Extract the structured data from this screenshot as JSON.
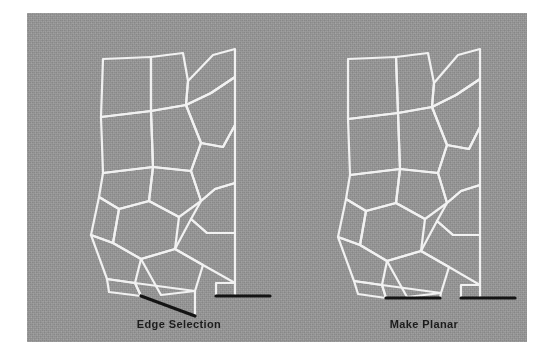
{
  "figure": {
    "kind": "3d-mesh-comparison-figure",
    "plate": {
      "background_color": "#969696",
      "page_color": "#ffffff",
      "x": 27,
      "y": 13,
      "width": 500,
      "height": 329
    },
    "style": {
      "wireframe_color": "#f2f2f2",
      "wireframe_width": 2.2,
      "selected_edge_color": "#141414",
      "selected_edge_width": 3.2,
      "caption_color": "#1c1c1c"
    },
    "panels": [
      {
        "id": "left",
        "caption": "Edge Selection",
        "description": "Quad mesh with an octagonal hole; one bottom edge is selected and is non-planar (slanted).",
        "selected_edges": [
          {
            "x1": 58,
            "y1": 263,
            "x2": 112,
            "y2": 283,
            "planar": false
          },
          {
            "x1": 133,
            "y1": 263,
            "x2": 187,
            "y2": 263,
            "planar": true
          }
        ]
      },
      {
        "id": "right",
        "caption": "Make Planar",
        "description": "Same mesh after the Make Planar operation; the selected edges are flattened to horizontal.",
        "selected_edges": [
          {
            "x1": 58,
            "y1": 265,
            "x2": 112,
            "y2": 265,
            "planar": true
          },
          {
            "x1": 133,
            "y1": 265,
            "x2": 187,
            "y2": 265,
            "planar": true
          }
        ]
      }
    ],
    "mesh": {
      "left_origin": {
        "x": 56,
        "y": 20
      },
      "right_origin": {
        "x": 301,
        "y": 20
      },
      "left_polygons": [
        [
          [
            20,
            26
          ],
          [
            68,
            24
          ],
          [
            68,
            78
          ],
          [
            18,
            84
          ]
        ],
        [
          [
            68,
            24
          ],
          [
            100,
            20
          ],
          [
            105,
            48
          ],
          [
            103,
            72
          ],
          [
            68,
            78
          ]
        ],
        [
          [
            103,
            72
          ],
          [
            105,
            48
          ],
          [
            130,
            22
          ],
          [
            152,
            16
          ],
          [
            152,
            44
          ],
          [
            128,
            60
          ]
        ],
        [
          [
            18,
            84
          ],
          [
            68,
            78
          ],
          [
            70,
            134
          ],
          [
            20,
            140
          ]
        ],
        [
          [
            68,
            78
          ],
          [
            103,
            72
          ],
          [
            118,
            110
          ],
          [
            108,
            138
          ],
          [
            70,
            134
          ]
        ],
        [
          [
            103,
            72
          ],
          [
            128,
            60
          ],
          [
            152,
            44
          ],
          [
            152,
            92
          ],
          [
            140,
            114
          ],
          [
            118,
            110
          ]
        ],
        [
          [
            20,
            140
          ],
          [
            70,
            134
          ],
          [
            66,
            168
          ],
          [
            36,
            176
          ],
          [
            16,
            164
          ]
        ],
        [
          [
            70,
            134
          ],
          [
            108,
            138
          ],
          [
            118,
            168
          ],
          [
            96,
            184
          ],
          [
            66,
            168
          ]
        ],
        [
          [
            108,
            138
          ],
          [
            118,
            110
          ],
          [
            140,
            114
          ],
          [
            152,
            92
          ],
          [
            152,
            150
          ],
          [
            132,
            156
          ],
          [
            118,
            168
          ]
        ],
        [
          [
            16,
            164
          ],
          [
            36,
            176
          ],
          [
            30,
            210
          ],
          [
            8,
            202
          ]
        ],
        [
          [
            36,
            176
          ],
          [
            66,
            168
          ],
          [
            96,
            184
          ],
          [
            92,
            216
          ],
          [
            58,
            226
          ],
          [
            30,
            210
          ]
        ],
        [
          [
            118,
            168
          ],
          [
            132,
            156
          ],
          [
            152,
            150
          ],
          [
            152,
            200
          ],
          [
            124,
            200
          ],
          [
            108,
            186
          ]
        ],
        [
          [
            8,
            202
          ],
          [
            30,
            210
          ],
          [
            58,
            226
          ],
          [
            52,
            250
          ],
          [
            24,
            246
          ]
        ],
        [
          [
            58,
            226
          ],
          [
            92,
            216
          ],
          [
            120,
            232
          ],
          [
            112,
            258
          ],
          [
            78,
            262
          ]
        ],
        [
          [
            92,
            216
          ],
          [
            108,
            186
          ],
          [
            124,
            200
          ],
          [
            152,
            200
          ],
          [
            152,
            250
          ],
          [
            120,
            232
          ]
        ],
        [
          [
            24,
            246
          ],
          [
            52,
            250
          ],
          [
            58,
            263
          ],
          [
            26,
            259
          ]
        ],
        [
          [
            58,
            263
          ],
          [
            52,
            250
          ],
          [
            112,
            258
          ],
          [
            112,
            283
          ]
        ],
        [
          [
            133,
            250
          ],
          [
            152,
            250
          ],
          [
            152,
            263
          ],
          [
            133,
            263
          ]
        ]
      ],
      "right_polygons": [
        [
          [
            20,
            26
          ],
          [
            68,
            24
          ],
          [
            70,
            80
          ],
          [
            20,
            86
          ]
        ],
        [
          [
            68,
            24
          ],
          [
            100,
            20
          ],
          [
            106,
            50
          ],
          [
            104,
            74
          ],
          [
            70,
            80
          ]
        ],
        [
          [
            104,
            74
          ],
          [
            106,
            50
          ],
          [
            130,
            22
          ],
          [
            152,
            16
          ],
          [
            152,
            46
          ],
          [
            128,
            62
          ]
        ],
        [
          [
            20,
            86
          ],
          [
            70,
            80
          ],
          [
            72,
            136
          ],
          [
            22,
            142
          ]
        ],
        [
          [
            70,
            80
          ],
          [
            104,
            74
          ],
          [
            119,
            112
          ],
          [
            110,
            140
          ],
          [
            72,
            136
          ]
        ],
        [
          [
            104,
            74
          ],
          [
            128,
            62
          ],
          [
            152,
            46
          ],
          [
            152,
            94
          ],
          [
            141,
            116
          ],
          [
            119,
            112
          ]
        ],
        [
          [
            22,
            142
          ],
          [
            72,
            136
          ],
          [
            68,
            170
          ],
          [
            38,
            178
          ],
          [
            18,
            166
          ]
        ],
        [
          [
            72,
            136
          ],
          [
            110,
            140
          ],
          [
            119,
            170
          ],
          [
            97,
            186
          ],
          [
            68,
            170
          ]
        ],
        [
          [
            110,
            140
          ],
          [
            119,
            112
          ],
          [
            141,
            116
          ],
          [
            152,
            94
          ],
          [
            152,
            152
          ],
          [
            133,
            158
          ],
          [
            119,
            170
          ]
        ],
        [
          [
            18,
            166
          ],
          [
            38,
            178
          ],
          [
            32,
            212
          ],
          [
            10,
            204
          ]
        ],
        [
          [
            38,
            178
          ],
          [
            68,
            170
          ],
          [
            97,
            186
          ],
          [
            93,
            218
          ],
          [
            59,
            228
          ],
          [
            32,
            212
          ]
        ],
        [
          [
            119,
            170
          ],
          [
            133,
            158
          ],
          [
            152,
            152
          ],
          [
            152,
            202
          ],
          [
            125,
            202
          ],
          [
            109,
            188
          ]
        ],
        [
          [
            10,
            204
          ],
          [
            32,
            212
          ],
          [
            59,
            228
          ],
          [
            54,
            252
          ],
          [
            26,
            248
          ]
        ],
        [
          [
            59,
            228
          ],
          [
            93,
            218
          ],
          [
            121,
            234
          ],
          [
            113,
            260
          ],
          [
            79,
            264
          ]
        ],
        [
          [
            93,
            218
          ],
          [
            109,
            188
          ],
          [
            125,
            202
          ],
          [
            152,
            202
          ],
          [
            152,
            252
          ],
          [
            121,
            234
          ]
        ],
        [
          [
            26,
            248
          ],
          [
            54,
            252
          ],
          [
            58,
            265
          ],
          [
            30,
            261
          ]
        ],
        [
          [
            58,
            265
          ],
          [
            54,
            252
          ],
          [
            113,
            260
          ],
          [
            112,
            265
          ]
        ],
        [
          [
            133,
            252
          ],
          [
            152,
            252
          ],
          [
            152,
            265
          ],
          [
            133,
            265
          ]
        ]
      ]
    }
  }
}
